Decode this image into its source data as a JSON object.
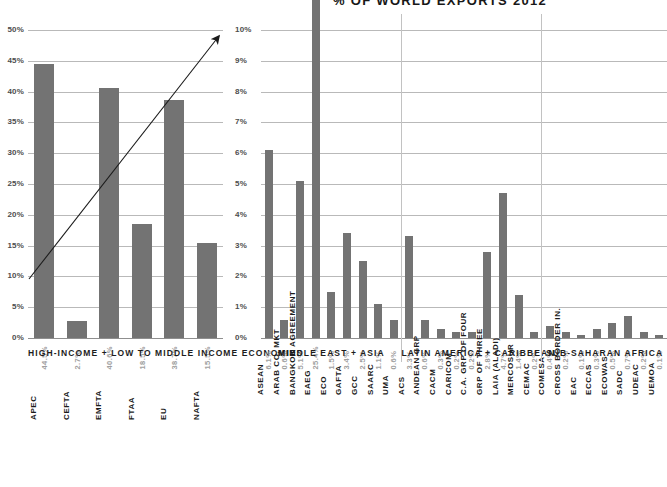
{
  "chart_data": [
    {
      "type": "bar",
      "id": "left",
      "title": "",
      "group_label": "HIGH-INCOME + LOW TO MIDDLE INCOME ECONOMIES",
      "categories": [
        "APEC",
        "CEFTA",
        "EMFTA",
        "FTAA",
        "EU",
        "NAFTA"
      ],
      "values": [
        44.5,
        2.7,
        40.6,
        18.5,
        38.7,
        15.5
      ],
      "value_labels": [
        "44.5%",
        "2.7%",
        "40.6%",
        "18.5%",
        "38.7%",
        "15.5%"
      ],
      "ylabel": "",
      "xlabel": "",
      "ylim": [
        0,
        50
      ],
      "ytick_labels": [
        "0%",
        "5%",
        "10%",
        "15%",
        "20%",
        "25%",
        "30%",
        "35%",
        "40%",
        "45%",
        "50%"
      ],
      "ytick_values": [
        0,
        5,
        10,
        15,
        20,
        25,
        30,
        35,
        40,
        45,
        50
      ],
      "grid": true,
      "legend": "none",
      "annotation": {
        "type": "arrow",
        "from_value": 10,
        "to_value": 50,
        "note": "upward trend arrow from 10% on left axis to 10% on right axis"
      }
    },
    {
      "type": "bar",
      "id": "right",
      "title": "% OF WORLD EXPORTS 2012",
      "ylabel": "",
      "xlabel": "",
      "ylim": [
        0,
        10
      ],
      "ytick_labels": [
        "0%",
        "1%",
        "2%",
        "3%",
        "4%",
        "5%",
        "6%",
        "7%",
        "8%",
        "9%",
        "10%"
      ],
      "ytick_values": [
        0,
        1,
        2,
        3,
        4,
        5,
        6,
        7,
        8,
        9,
        10
      ],
      "grid": true,
      "legend": "none",
      "groups": [
        {
          "label": "MIDDLE EAST + ASIA",
          "categories": [
            "ASEAN",
            "ARAB CO. MKT",
            "BANGKOK AGREEMENT",
            "EAEG",
            "ECO",
            "GAFTA",
            "GCC",
            "SAARC",
            "UMA"
          ],
          "values": [
            6.1,
            0.6,
            5.1,
            25.4,
            1.5,
            3.4,
            2.5,
            1.1,
            0.6
          ],
          "value_labels": [
            "6.1%",
            "0.6%",
            "5.1%",
            "25.4%",
            "1.5%",
            "3.4%",
            "2.5%",
            "1.1%",
            "0.6%"
          ]
        },
        {
          "label": "LATIN AMERICA + CARIBBEAN",
          "categories": [
            "ACS",
            "ANDEAN GRP",
            "CACM",
            "CARICOM",
            "C.A. GRP OF FOUR",
            "GRP OF THREE",
            "LAIA (ALADI)",
            "MERCOSUR",
            "CEMAC"
          ],
          "values": [
            3.3,
            0.6,
            0.3,
            0.2,
            0.2,
            2.8,
            4.7,
            1.4,
            0.2
          ],
          "value_labels": [
            "3.3%",
            "0.6%",
            "0.3%",
            "0.2%",
            "0.2%",
            "2.8%",
            "4.7%",
            "1.4%",
            "0.2%"
          ]
        },
        {
          "label": "SUB-SAHARAN AFRICA",
          "categories": [
            "COMESA",
            "CROSS BORDER IN.",
            "EAC",
            "ECCAS",
            "ECOWAS",
            "SADC",
            "UDEAC",
            "UEMOA"
          ],
          "values": [
            0.4,
            0.2,
            0.1,
            0.3,
            0.5,
            0.7,
            0.2,
            0.1
          ],
          "value_labels": [
            "0.4%",
            "0.2%",
            "0.1%",
            "0.3%",
            "0.5%",
            "0.7%",
            "0.2%",
            "0.1%"
          ]
        }
      ]
    }
  ],
  "style": {
    "bar_color": "#737373",
    "grid_color": "#b9b9b9",
    "axis_color": "#8a8a8a",
    "label_color": "#1b1b1b",
    "value_color": "#a0a0a0",
    "background": "#ffffff"
  }
}
